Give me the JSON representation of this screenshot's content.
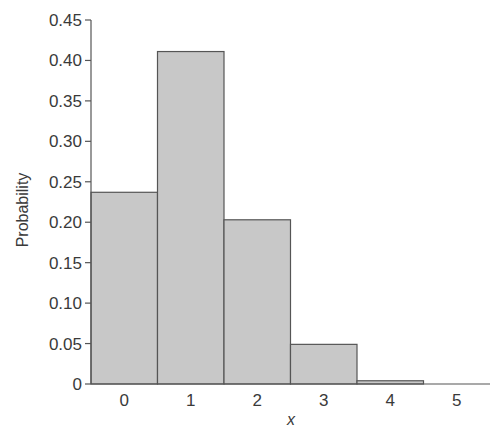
{
  "chart_data": {
    "type": "bar",
    "title": "",
    "xlabel": "x",
    "ylabel": "Probability",
    "categories": [
      "0",
      "1",
      "2",
      "3",
      "4",
      "5"
    ],
    "values": [
      0.237,
      0.411,
      0.203,
      0.049,
      0.004,
      0.0
    ],
    "ylim": [
      0,
      0.45
    ],
    "yticks": [
      "0",
      "0.05",
      "0.10",
      "0.15",
      "0.20",
      "0.25",
      "0.30",
      "0.35",
      "0.40",
      "0.45"
    ],
    "grid": false,
    "legend": null,
    "bar_color": "#c8c8c8",
    "edge_color": "#555555"
  }
}
